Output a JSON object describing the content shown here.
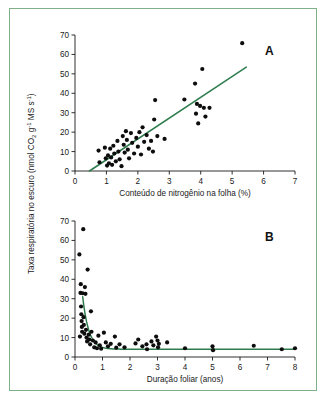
{
  "figure": {
    "frame_color": "#7fb087",
    "background": "#ffffff",
    "line_color": "#2f7d4f",
    "point_color": "#0d0d0d",
    "shared_ylabel": "Taxa respiratória no escuro (nmol CO2 g-1 MS s-1)",
    "shared_ylabel_parts": {
      "prefix": "Taxa respiratória no escuro (nmol CO",
      "sub_2": "2",
      "mid": " g",
      "sup_1": "-1",
      "mid2": " MS s",
      "sup_2": "-1",
      "suffix": ")"
    }
  },
  "chart_data": [
    {
      "type": "scatter",
      "panel": "A",
      "title": "",
      "xlabel": "Conteúdo de nitrogênio na folha (%)",
      "ylabel": "Taxa respiratória no escuro (nmol CO2 g-1 MS s-1)",
      "xlim": [
        0,
        7
      ],
      "ylim": [
        0,
        70
      ],
      "xticks": [
        0,
        1,
        2,
        3,
        4,
        5,
        6,
        7
      ],
      "yticks": [
        0,
        10,
        20,
        30,
        40,
        50,
        60,
        70
      ],
      "grid": false,
      "legend": null,
      "points": [
        [
          0.75,
          10.5
        ],
        [
          0.78,
          4.5
        ],
        [
          0.95,
          12.0
        ],
        [
          0.98,
          6.5
        ],
        [
          1.02,
          2.8
        ],
        [
          1.05,
          8.0
        ],
        [
          1.08,
          4.0
        ],
        [
          1.12,
          11.5
        ],
        [
          1.15,
          7.0
        ],
        [
          1.18,
          3.2
        ],
        [
          1.22,
          13.0
        ],
        [
          1.25,
          9.0
        ],
        [
          1.3,
          5.0
        ],
        [
          1.35,
          15.5
        ],
        [
          1.38,
          10.0
        ],
        [
          1.42,
          6.0
        ],
        [
          1.48,
          2.5
        ],
        [
          1.52,
          18.0
        ],
        [
          1.55,
          13.5
        ],
        [
          1.58,
          9.5
        ],
        [
          1.62,
          20.5
        ],
        [
          1.65,
          16.0
        ],
        [
          1.68,
          11.0
        ],
        [
          1.72,
          6.5
        ],
        [
          1.78,
          19.5
        ],
        [
          1.82,
          14.5
        ],
        [
          1.88,
          9.0
        ],
        [
          1.95,
          17.0
        ],
        [
          2.0,
          12.5
        ],
        [
          2.05,
          20.0
        ],
        [
          2.1,
          8.5
        ],
        [
          2.15,
          22.5
        ],
        [
          2.2,
          15.0
        ],
        [
          2.28,
          18.5
        ],
        [
          2.35,
          11.5
        ],
        [
          2.42,
          15.5
        ],
        [
          2.48,
          10.0
        ],
        [
          2.52,
          26.5
        ],
        [
          2.55,
          36.5
        ],
        [
          2.62,
          18.0
        ],
        [
          2.85,
          16.5
        ],
        [
          3.48,
          36.8
        ],
        [
          3.82,
          45.0
        ],
        [
          3.85,
          29.5
        ],
        [
          3.88,
          34.5
        ],
        [
          3.92,
          24.5
        ],
        [
          3.98,
          33.5
        ],
        [
          4.05,
          52.5
        ],
        [
          4.1,
          32.5
        ],
        [
          4.15,
          28.0
        ],
        [
          4.28,
          32.5
        ],
        [
          5.32,
          65.8
        ]
      ],
      "fit_line": {
        "type": "linear",
        "x_start": 0.46,
        "y_start": 0.0,
        "x_end": 5.45,
        "y_end": 53.5
      }
    },
    {
      "type": "scatter",
      "panel": "B",
      "title": "",
      "xlabel": "Duração foliar (anos)",
      "ylabel": "Taxa respiratória no escuro (nmol CO2 g-1 MS s-1)",
      "xlim": [
        0,
        8
      ],
      "ylim": [
        0,
        70
      ],
      "xticks": [
        0,
        1,
        2,
        3,
        4,
        5,
        6,
        7,
        8
      ],
      "yticks": [
        0,
        10,
        20,
        30,
        40,
        50,
        60,
        70
      ],
      "grid": false,
      "legend": null,
      "points": [
        [
          0.16,
          52.8
        ],
        [
          0.18,
          10.5
        ],
        [
          0.2,
          33.0
        ],
        [
          0.21,
          37.5
        ],
        [
          0.22,
          26.0
        ],
        [
          0.23,
          22.0
        ],
        [
          0.24,
          18.5
        ],
        [
          0.25,
          15.5
        ],
        [
          0.26,
          13.0
        ],
        [
          0.28,
          32.8
        ],
        [
          0.3,
          65.8
        ],
        [
          0.31,
          20.5
        ],
        [
          0.32,
          16.5
        ],
        [
          0.34,
          12.0
        ],
        [
          0.36,
          36.0
        ],
        [
          0.38,
          32.5
        ],
        [
          0.4,
          14.0
        ],
        [
          0.42,
          10.0
        ],
        [
          0.44,
          8.0
        ],
        [
          0.46,
          45.0
        ],
        [
          0.5,
          11.5
        ],
        [
          0.52,
          9.0
        ],
        [
          0.55,
          6.5
        ],
        [
          0.58,
          23.5
        ],
        [
          0.6,
          13.0
        ],
        [
          0.65,
          8.5
        ],
        [
          0.7,
          5.0
        ],
        [
          0.75,
          7.5
        ],
        [
          0.8,
          4.5
        ],
        [
          0.85,
          11.0
        ],
        [
          0.9,
          6.0
        ],
        [
          0.95,
          4.3
        ],
        [
          1.05,
          12.5
        ],
        [
          1.12,
          7.5
        ],
        [
          1.2,
          5.5
        ],
        [
          1.3,
          6.8
        ],
        [
          1.45,
          10.5
        ],
        [
          1.5,
          4.8
        ],
        [
          1.62,
          6.5
        ],
        [
          1.8,
          5.0
        ],
        [
          2.2,
          7.0
        ],
        [
          2.3,
          9.0
        ],
        [
          2.45,
          5.5
        ],
        [
          2.6,
          6.5
        ],
        [
          2.62,
          4.0
        ],
        [
          2.78,
          8.0
        ],
        [
          2.85,
          6.0
        ],
        [
          2.95,
          10.5
        ],
        [
          3.0,
          8.5
        ],
        [
          3.02,
          5.0
        ],
        [
          3.05,
          6.8
        ],
        [
          3.35,
          7.5
        ],
        [
          4.0,
          4.5
        ],
        [
          5.0,
          5.5
        ],
        [
          5.02,
          3.5
        ],
        [
          6.5,
          5.8
        ],
        [
          7.52,
          4.0
        ],
        [
          8.0,
          4.5
        ]
      ],
      "fit_line": {
        "type": "exponential_decay",
        "y0": 4.0,
        "amplitude": 98.0,
        "decay": 4.6,
        "x_start": 0.28,
        "x_end": 8.0
      }
    }
  ],
  "labels": {
    "panel_a": "A",
    "panel_b": "B"
  }
}
